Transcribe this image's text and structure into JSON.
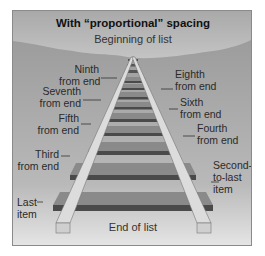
{
  "diagram": {
    "title": "With “proportional” spacing",
    "top_label": "Beginning of list",
    "bottom_label": "End of list",
    "left_labels": [
      {
        "line1": "Ninth",
        "line2": "from end"
      },
      {
        "line1": "Seventh",
        "line2": "from end"
      },
      {
        "line1": "Fifth",
        "line2": "from end"
      },
      {
        "line1": "Third",
        "line2": "from end"
      },
      {
        "line1": "Last",
        "line2": "item"
      }
    ],
    "right_labels": [
      {
        "line1": "Eighth",
        "line2": "from end"
      },
      {
        "line1": "Sixth",
        "line2": "from end"
      },
      {
        "line1": "Fourth",
        "line2": "from end"
      },
      {
        "line1": "Second-",
        "line2": "to-last",
        "line3": "item"
      }
    ],
    "colors": {
      "sky_top": "#e9e9e9",
      "sky_bottom": "#cfcfcf",
      "ground": "#a9a9a9",
      "tie_top": "#8f8f8f",
      "tie_front": "#4f4f4f",
      "rail": "#d9d9d9",
      "border": "#8a8a8a"
    }
  }
}
